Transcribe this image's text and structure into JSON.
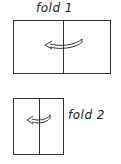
{
  "diagram": {
    "steps": [
      {
        "label": "fold 1",
        "direction": "right-to-left"
      },
      {
        "label": "fold 2",
        "direction": "right-to-left"
      }
    ],
    "colors": {
      "stroke": "#333333",
      "background": "#ffffff"
    }
  }
}
